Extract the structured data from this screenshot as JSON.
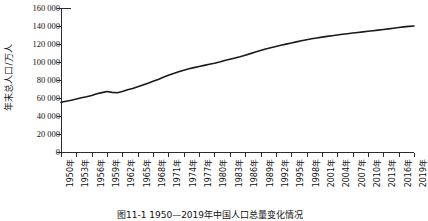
{
  "chart_data": {
    "type": "line",
    "title": "",
    "caption": "图11-1  1950—2019年中国人口总量变化情况",
    "xlabel": "",
    "ylabel": "年末总人口/万人",
    "ylim": [
      0,
      160000
    ],
    "yticks": [
      0,
      20000,
      40000,
      60000,
      80000,
      100000,
      120000,
      140000,
      160000
    ],
    "ytick_labels": [
      "0",
      "20 000",
      "40 000",
      "60 000",
      "80 000",
      "100 000",
      "120 000",
      "140 000",
      "160 000"
    ],
    "xtick_labels": [
      "1950年",
      "1953年",
      "1956年",
      "1959年",
      "1962年",
      "1965年",
      "1968年",
      "1971年",
      "1974年",
      "1977年",
      "1980年",
      "1983年",
      "1986年",
      "1989年",
      "1992年",
      "1995年",
      "1998年",
      "2001年",
      "2004年",
      "2007年",
      "2010年",
      "2013年",
      "2016年",
      "2019年"
    ],
    "grid": false,
    "legend": "none",
    "line_color": "#1a1a1a",
    "line_width": 1.6,
    "x": [
      1950,
      1951,
      1952,
      1953,
      1954,
      1955,
      1956,
      1957,
      1958,
      1959,
      1960,
      1961,
      1962,
      1963,
      1964,
      1965,
      1966,
      1967,
      1968,
      1969,
      1970,
      1971,
      1972,
      1973,
      1974,
      1975,
      1976,
      1977,
      1978,
      1979,
      1980,
      1981,
      1982,
      1983,
      1984,
      1985,
      1986,
      1987,
      1988,
      1989,
      1990,
      1991,
      1992,
      1993,
      1994,
      1995,
      1996,
      1997,
      1998,
      1999,
      2000,
      2001,
      2002,
      2003,
      2004,
      2005,
      2006,
      2007,
      2008,
      2009,
      2010,
      2011,
      2012,
      2013,
      2014,
      2015,
      2016,
      2017,
      2018,
      2019
    ],
    "values": [
      55196,
      56300,
      57482,
      58796,
      60266,
      61465,
      62828,
      64653,
      65994,
      67207,
      66207,
      65859,
      67296,
      69172,
      70499,
      72538,
      74542,
      76368,
      78534,
      80671,
      82992,
      85229,
      87177,
      89211,
      90859,
      92420,
      93717,
      94974,
      96259,
      97542,
      98705,
      100072,
      101654,
      103008,
      104357,
      105851,
      107507,
      109300,
      111026,
      112704,
      114333,
      115823,
      117171,
      118517,
      119850,
      121121,
      122389,
      123626,
      124761,
      125786,
      126743,
      127627,
      128453,
      129227,
      129988,
      130756,
      131448,
      132129,
      132802,
      133450,
      134091,
      134735,
      135404,
      136072,
      136782,
      137462,
      138271,
      139008,
      139538,
      140005
    ],
    "annotations": []
  }
}
